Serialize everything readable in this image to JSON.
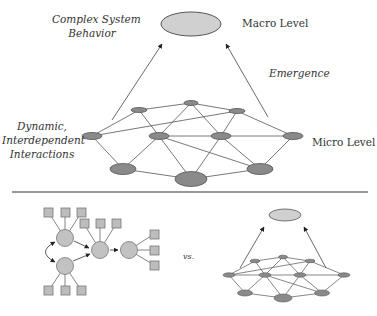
{
  "labels": {
    "complex_system_behavior": [
      "Complex System",
      "Behavior"
    ],
    "macro_level": "Macro Level",
    "emergence": "Emergence",
    "dynamic_interactions": [
      "Dynamic,",
      "Interdependent",
      "Interactions"
    ],
    "micro_level": "Micro Level",
    "versus": "vs."
  },
  "colors": {
    "macro_fill": "#cfcfcf",
    "node_fill": "#8a8a8a",
    "node_stroke": "#555555",
    "edge": "#555555",
    "box_fill": "#bdbdbd",
    "circle_fill": "#c2c2c2",
    "divider": "#333333"
  }
}
